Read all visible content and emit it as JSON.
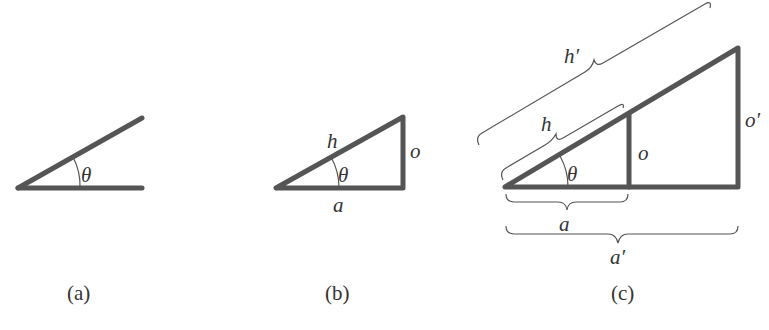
{
  "figure": {
    "panels": [
      {
        "id": "a",
        "caption": "(a)",
        "labels": {
          "angle": "θ"
        }
      },
      {
        "id": "b",
        "caption": "(b)",
        "labels": {
          "hypotenuse": "h",
          "opposite": "o",
          "adjacent": "a",
          "angle": "θ"
        }
      },
      {
        "id": "c",
        "caption": "(c)",
        "labels": {
          "hypotenuse_small": "h",
          "hypotenuse_large": "h′",
          "opposite_small": "o",
          "opposite_large": "o′",
          "adjacent_small": "a",
          "adjacent_large": "a′",
          "angle": "θ"
        }
      }
    ],
    "colors": {
      "stroke": "#555555",
      "text": "#333333",
      "background": "#ffffff"
    }
  }
}
